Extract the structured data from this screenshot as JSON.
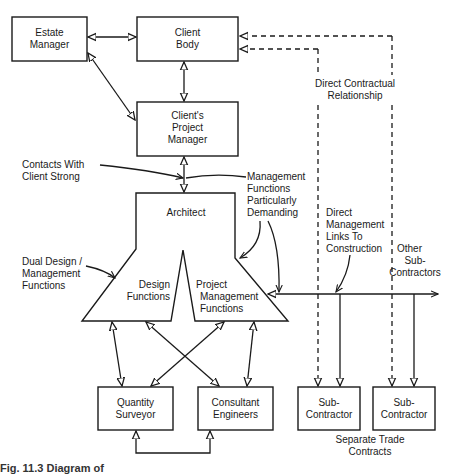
{
  "boxes": {
    "estate_manager": [
      "Estate",
      "Manager"
    ],
    "client_body": [
      "Client",
      "Body"
    ],
    "clients_project_manager": [
      "Client's",
      "Project",
      "Manager"
    ],
    "architect": "Architect",
    "design_functions": [
      "Design",
      "Functions"
    ],
    "project_management_functions": [
      "Project",
      "Management",
      "Functions"
    ],
    "quantity_surveyor": [
      "Quantity",
      "Surveyor"
    ],
    "consultant_engineers": [
      "Consultant",
      "Engineers"
    ],
    "sub_contractor_1": [
      "Sub-",
      "Contractor"
    ],
    "sub_contractor_2": [
      "Sub-",
      "Contractor"
    ]
  },
  "annotations": {
    "direct_contractual": [
      "Direct Contractual",
      "Relationship"
    ],
    "contacts_with_client": [
      "Contacts With",
      "Client Strong"
    ],
    "management_demanding": [
      "Management",
      "Functions",
      "Particularly",
      "Demanding"
    ],
    "direct_management_links": [
      "Direct",
      "Management",
      "Links To",
      "Construction"
    ],
    "other_subcontractors": [
      "Other",
      "Sub-",
      "Contractors"
    ],
    "dual_design": [
      "Dual Design /",
      "Management",
      "Functions"
    ],
    "separate_trade": [
      "Separate Trade",
      "Contracts"
    ]
  },
  "caption": "Fig. 11.3  Diagram of"
}
